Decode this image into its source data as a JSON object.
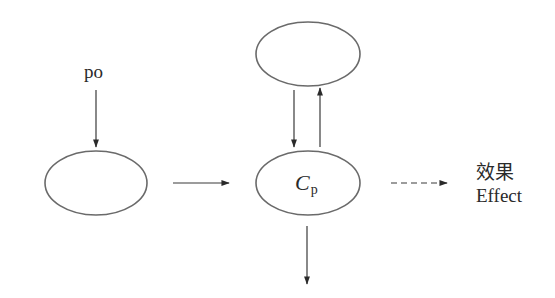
{
  "diagram": {
    "nodes": [
      {
        "id": "input-node",
        "label": "",
        "cx": 96,
        "cy": 183,
        "rx": 51,
        "ry": 32
      },
      {
        "id": "upper-node",
        "label": "",
        "cx": 308,
        "cy": 54,
        "rx": 52,
        "ry": 32
      },
      {
        "id": "cp-node",
        "label_main": "C",
        "label_sub": "p",
        "cx": 308,
        "cy": 183,
        "rx": 52,
        "ry": 32
      }
    ],
    "labels": {
      "po": "po",
      "cp_main": "C",
      "cp_sub": "p",
      "effect_zh": "效果",
      "effect_en": "Effect"
    },
    "edges": [
      {
        "id": "po-to-input",
        "from": "po",
        "to": "input-node",
        "style": "solid",
        "direction": "down"
      },
      {
        "id": "input-to-cp",
        "from": "input-node",
        "to": "cp-node",
        "style": "solid",
        "direction": "right"
      },
      {
        "id": "upper-to-cp",
        "from": "upper-node",
        "to": "cp-node",
        "style": "solid",
        "direction": "down"
      },
      {
        "id": "cp-to-upper",
        "from": "cp-node",
        "to": "upper-node",
        "style": "solid",
        "direction": "up"
      },
      {
        "id": "cp-to-below",
        "from": "cp-node",
        "to": "",
        "style": "solid",
        "direction": "down"
      },
      {
        "id": "cp-to-effect",
        "from": "cp-node",
        "to": "effect",
        "style": "dashed",
        "direction": "right"
      }
    ],
    "colors": {
      "node_stroke": "#6a6a6a",
      "edge_stroke": "#3a3a3a",
      "text": "#2a2a2a",
      "background": "#ffffff"
    }
  }
}
